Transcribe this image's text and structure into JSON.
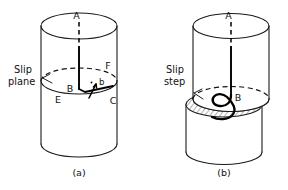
{
  "figure": {
    "background_color": "#ffffff",
    "ink_color": "#111111",
    "width": 288,
    "height": 190
  },
  "panels": [
    {
      "id": "a",
      "caption": "(a)",
      "annotation_label_line1": "Slip",
      "annotation_label_line2": "plane",
      "point_labels": {
        "top": "A",
        "center": "B",
        "right_front": "C",
        "left_front": "E",
        "right_back": "F",
        "burgers_vector": "b"
      }
    },
    {
      "id": "b",
      "caption": "(b)",
      "annotation_label_line1": "Slip",
      "annotation_label_line2": "step",
      "point_labels": {
        "top": "A",
        "center": "B"
      }
    }
  ]
}
